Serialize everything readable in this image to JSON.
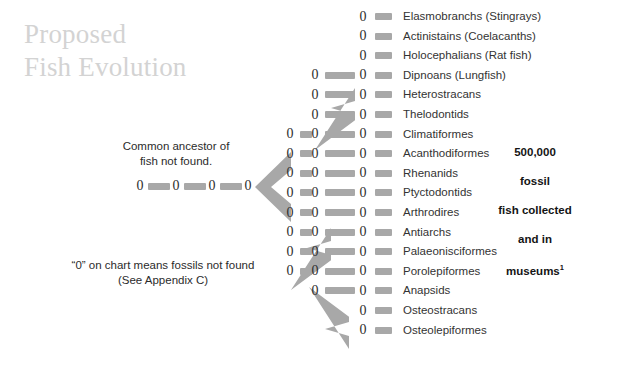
{
  "title": "Proposed\nFish Evolution",
  "notes": {
    "ancestor": "Common ancestor of\nfish not found.",
    "legend": "“0” on chart means fossils not found\n(See Appendix C)"
  },
  "fossil_count": {
    "line1": "500,000",
    "line2": "fossil",
    "line3": "fish collected",
    "line4": "and in",
    "line5": "museums",
    "footnote_marker": "1"
  },
  "zero_symbol": "0",
  "colors": {
    "title": "#d3d3d3",
    "dash": "#a8a8a8",
    "arrow": "#a8a8a8",
    "text": "#2b2b2b",
    "zero": "#2e2e2e",
    "background": "#ffffff"
  },
  "chart_data": {
    "type": "diagram",
    "title": "Proposed Fish Evolution",
    "taxa": [
      "Elasmobranchs (Stingrays)",
      "Actinistains (Coelacanths)",
      "Holocephalians (Rat fish)",
      "Dipnoans (Lungfish)",
      "Heterostracans",
      "Thelodontids",
      "Climatiformes",
      "Acanthodiformes",
      "Rhenanids",
      "Ptyctodontids",
      "Arthrodires",
      "Antiarchs",
      "Palaeonisciformes",
      "Porolepiformes",
      "Anapsids",
      "Osteostracans",
      "Osteolepiformes"
    ],
    "taxon_count": 17,
    "stem": {
      "zeros": 4,
      "dashes": 3,
      "label": "Common ancestor of fish not found."
    },
    "columns": [
      {
        "name": "stem",
        "zeros": 4,
        "x": 140
      },
      {
        "name": "branch-1",
        "zeros": 12,
        "x": 315
      },
      {
        "name": "branch-2",
        "zeros": 8,
        "x": 290
      },
      {
        "name": "branch-3",
        "zeros": 18,
        "x": 363
      }
    ],
    "arrows": 4,
    "total_zeros_visible": 42
  }
}
